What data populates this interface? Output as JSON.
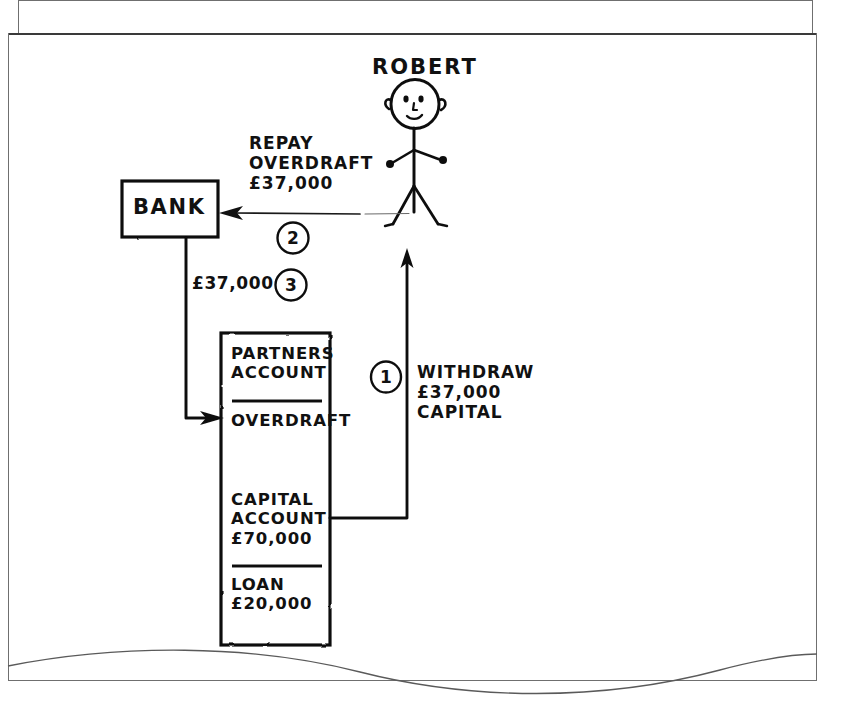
{
  "document": {
    "kind": "hand-drawn-diagram",
    "ink_color": "#111111",
    "paper_color": "#ffffff",
    "frame_color": "#6f6f6f"
  },
  "person": {
    "name": "ROBERT",
    "icon": "stick-figure-person"
  },
  "bank": {
    "label": "BANK"
  },
  "account_box": {
    "title_line_1": "PARTNERS",
    "title_line_2": "ACCOUNT",
    "title": "PARTNERS\nACCOUNT",
    "rows": [
      {
        "name": "OVERDRAFT",
        "label": "OVERDRAFT",
        "amount": ""
      },
      {
        "name": "CAPITAL ACCOUNT",
        "label": "CAPITAL\nACCOUNT\n£70,000",
        "amount": "£70,000"
      },
      {
        "name": "LOAN",
        "label": "LOAN\n£20,000",
        "amount": "£20,000"
      }
    ]
  },
  "steps": [
    {
      "number": "1",
      "badge": "1",
      "label": "WITHDRAW\n£37,000\nCAPITAL",
      "action": "WITHDRAW",
      "amount": "£37,000",
      "from": "CAPITAL ACCOUNT",
      "to": "ROBERT"
    },
    {
      "number": "2",
      "badge": "2",
      "label": "REPAY\nOVERDRAFT\n£37,000",
      "action": "REPAY OVERDRAFT",
      "amount": "£37,000",
      "from": "ROBERT",
      "to": "BANK"
    },
    {
      "number": "3",
      "badge": "3",
      "label": "£37,000",
      "action": "TRANSFER",
      "amount": "£37,000",
      "from": "BANK",
      "to": "OVERDRAFT"
    }
  ]
}
